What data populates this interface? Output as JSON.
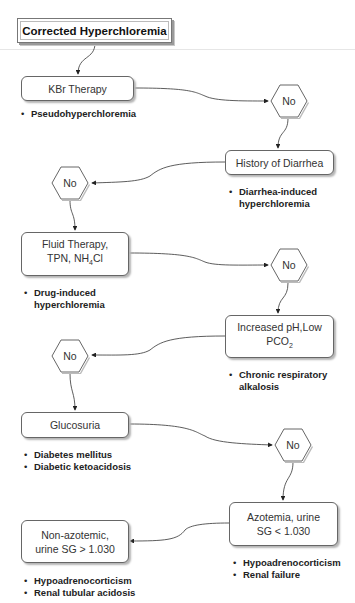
{
  "title": "Corrected Hyperchloremia",
  "nodes": {
    "kbr": {
      "label": "KBr Therapy",
      "bullets": [
        "Pseudohyperchloremia"
      ]
    },
    "diarrhea": {
      "label": "History of Diarrhea",
      "bullets": [
        "Diarrhea-induced hyperchloremia"
      ]
    },
    "fluid": {
      "line1": "Fluid Therapy,",
      "line2_pre": "TPN, NH",
      "line2_sub": "4",
      "line2_post": "Cl",
      "bullets": [
        "Drug-induced hyperchloremia"
      ]
    },
    "ph": {
      "line1": "Increased pH,Low",
      "line2_pre": "PCO",
      "line2_sub": "2",
      "bullets": [
        "Chronic respiratory alkalosis"
      ]
    },
    "glucosuria": {
      "label": "Glucosuria",
      "bullets": [
        "Diabetes mellitus",
        "Diabetic ketoacidosis"
      ]
    },
    "azotemia": {
      "line1": "Azotemia, urine",
      "line2": "SG < 1.030",
      "bullets": [
        "Hypoadrenocorticism",
        "Renal failure"
      ]
    },
    "nonazotemic": {
      "line1": "Non-azotemic,",
      "line2": "urine SG > 1.030",
      "bullets": [
        "Hypoadrenocorticism",
        "Renal tubular acidosis"
      ]
    }
  },
  "decisions": [
    "No",
    "No",
    "No",
    "No",
    "No"
  ]
}
